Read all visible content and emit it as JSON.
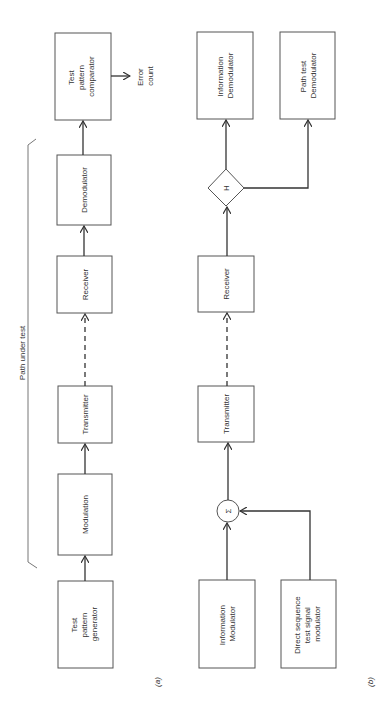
{
  "figure": {
    "panel_a": {
      "caption": "(a)",
      "bracket_label": "Path under test",
      "blocks": {
        "generator": [
          "Test",
          "pattern",
          "generator"
        ],
        "modulation": [
          "Modulation"
        ],
        "transmitter": [
          "Transmitter"
        ],
        "receiver": [
          "Receiver"
        ],
        "demodulator": [
          "Demodulator"
        ],
        "comparator": [
          "Test",
          "pattern",
          "comparator"
        ]
      },
      "output_label": [
        "Error",
        "count"
      ]
    },
    "panel_b": {
      "caption": "(b)",
      "blocks": {
        "info_modulator": [
          "Information",
          "Modulator"
        ],
        "ds_modulator": [
          "Direct sequence",
          "test signal",
          "modulator"
        ],
        "summer_symbol": "Σ",
        "transmitter": [
          "Transmitter"
        ],
        "receiver": [
          "Receiver"
        ],
        "hybrid_symbol": "H",
        "info_demodulator": [
          "Information",
          "Demodulator"
        ],
        "path_test_demodulator": [
          "Path test",
          "Demodulator"
        ]
      }
    }
  }
}
